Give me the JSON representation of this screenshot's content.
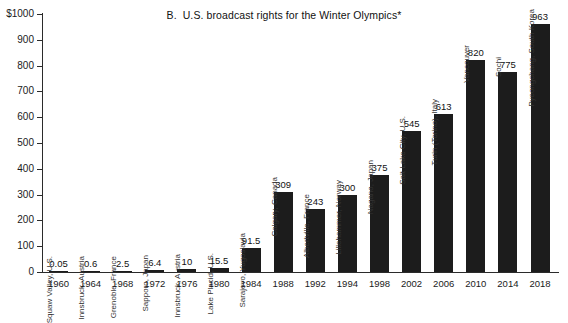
{
  "chart_data": {
    "type": "bar",
    "title": "B.  U.S. broadcast rights for the Winter Olympics*",
    "xlabel": "",
    "ylabel": "",
    "ylim": [
      0,
      1000
    ],
    "grid": false,
    "legend": "none",
    "y_ticks": [
      "0",
      "100",
      "200",
      "300",
      "400",
      "500",
      "600",
      "700",
      "800",
      "900",
      "$1000"
    ],
    "y_tick_values": [
      0,
      100,
      200,
      300,
      400,
      500,
      600,
      700,
      800,
      900,
      1000
    ],
    "categories": [
      "1960",
      "1964",
      "1968",
      "1972",
      "1976",
      "1980",
      "1984",
      "1988",
      "1992",
      "1994",
      "1998",
      "2002",
      "2006",
      "2010",
      "2014",
      "2018"
    ],
    "values": [
      0.05,
      0.6,
      2.5,
      6.4,
      10,
      15.5,
      91.5,
      309,
      243,
      300,
      375,
      545,
      613,
      820,
      775,
      963
    ],
    "value_labels": [
      "0.05",
      "0.6",
      "2.5",
      "6.4",
      "10",
      "15.5",
      "91.5",
      "309",
      "243",
      "300",
      "375",
      "545",
      "613",
      "820",
      "775",
      "963"
    ],
    "point_labels": [
      "Squaw Valley, U.S.",
      "Innsbruck, Austria",
      "Grenoble, France",
      "Sapporo, Japan",
      "Innsbruck, Austria",
      "Lake Placid, U.S.",
      "Sarajevo, Yugoslavia",
      "Calgary, Canada",
      "Albertville, France",
      "Lillehammer, Norway",
      "Nagano, Japan",
      "Salt Lake City, U.S.",
      "Turin (Torino), Italy",
      "Vancouver",
      "Sochi",
      "Pyeongchang, South Korea"
    ],
    "bar_color": "#1c1c1c",
    "axis_color": "#2b2b2b",
    "background_color": "#ffffff"
  }
}
